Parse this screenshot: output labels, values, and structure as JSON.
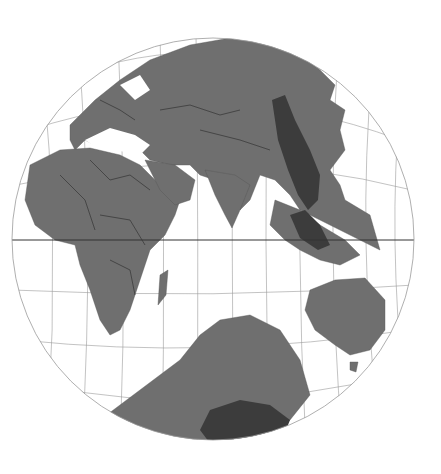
{
  "map": {
    "projection": "orthographic-globe",
    "center": {
      "cx": 213,
      "cy": 239,
      "r": 201
    },
    "equator_y": 240,
    "colors": {
      "ocean": "#ffffff",
      "land": "#6f6f6f",
      "highlight_region": "#3c3c3c",
      "graticule": "#9a9a9a",
      "borders": "#2a2a2a"
    },
    "regions_visible": [
      "Europe",
      "Africa",
      "Middle East",
      "Asia",
      "Indian Ocean",
      "Southeast Asia",
      "Australia",
      "Antarctica"
    ],
    "highlighted_regions": [
      "East Asian highland belt",
      "Indochina/Borneo area",
      "Antarctic sector near bottom"
    ]
  }
}
